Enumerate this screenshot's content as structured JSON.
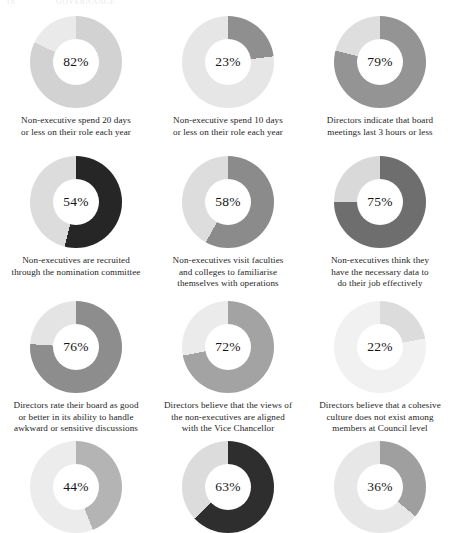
{
  "page_header": {
    "number": "18",
    "title": "GOVERNANCE",
    "visible": "partially cropped running header"
  },
  "layout": {
    "columns": 3,
    "rows": 4,
    "background": "#ffffff"
  },
  "palette": {
    "very_light_grey": "#e9e9e9",
    "light_grey": "#d5d5d5",
    "mid_grey": "#bdbdbd",
    "grey": "#9a9a9a",
    "dark_grey": "#808080",
    "near_black": "#2b2b2b",
    "hole": "#ffffff",
    "value_text": "#161616",
    "caption_text": "#1d1d1d"
  },
  "chart_data": {
    "type": "pie",
    "subtype": "donut-grid",
    "legend": "none",
    "units": "percent",
    "charts": [
      {
        "id": "chart-1",
        "value": 82,
        "value_label": "82%",
        "remainder": 18,
        "fill_color": "#d2d2d2",
        "track_color": "#eaeaea",
        "caption": [
          "Non-executive spend 20 days",
          "or less on their role each year"
        ],
        "row": 1,
        "col": 1
      },
      {
        "id": "chart-2",
        "value": 23,
        "value_label": "23%",
        "remainder": 77,
        "fill_color": "#8f8f8f",
        "track_color": "#e6e6e6",
        "caption": [
          "Non-executive spend 10 days",
          "or less on their role each year"
        ],
        "row": 1,
        "col": 2
      },
      {
        "id": "chart-3",
        "value": 79,
        "value_label": "79%",
        "remainder": 21,
        "fill_color": "#949494",
        "track_color": "#dedede",
        "caption": [
          "Directors indicate that board",
          "meetings last 3 hours or less"
        ],
        "row": 1,
        "col": 3
      },
      {
        "id": "chart-4",
        "value": 54,
        "value_label": "54%",
        "remainder": 46,
        "fill_color": "#262626",
        "track_color": "#dcdcdc",
        "caption": [
          "Non-executives are recruited",
          "through the nomination committee"
        ],
        "row": 2,
        "col": 1
      },
      {
        "id": "chart-5",
        "value": 58,
        "value_label": "58%",
        "remainder": 42,
        "fill_color": "#8b8b8b",
        "track_color": "#dddddd",
        "caption": [
          "Non-executives visit faculties",
          "and colleges to familiarise",
          "themselves with operations"
        ],
        "row": 2,
        "col": 2
      },
      {
        "id": "chart-6",
        "value": 75,
        "value_label": "75%",
        "remainder": 25,
        "fill_color": "#6e6e6e",
        "track_color": "#d9d9d9",
        "caption": [
          "Non-executives think they",
          "have the necessary data to",
          "do their job effectively"
        ],
        "row": 2,
        "col": 3
      },
      {
        "id": "chart-7",
        "value": 76,
        "value_label": "76%",
        "remainder": 24,
        "fill_color": "#8d8d8d",
        "track_color": "#e4e4e4",
        "caption": [
          "Directors rate their board as good",
          "or better in its ability to handle",
          "awkward or sensitive discussions"
        ],
        "row": 3,
        "col": 1
      },
      {
        "id": "chart-8",
        "value": 72,
        "value_label": "72%",
        "remainder": 28,
        "fill_color": "#a3a3a3",
        "track_color": "#ebebeb",
        "caption": [
          "Directors believe that the views of",
          "the non-executives are aligned",
          "with the Vice Chancellor"
        ],
        "row": 3,
        "col": 2
      },
      {
        "id": "chart-9",
        "value": 22,
        "value_label": "22%",
        "remainder": 78,
        "fill_color": "#dcdcdc",
        "track_color": "#f1f1f1",
        "caption": [
          "Directors believe that a cohesive",
          "culture does not exist among",
          "members at Council level"
        ],
        "row": 3,
        "col": 3
      },
      {
        "id": "chart-10",
        "value": 44,
        "value_label": "44%",
        "remainder": 56,
        "fill_color": "#b4b4b4",
        "track_color": "#ececec",
        "caption": [
          "Chairs effectively deal with",
          "non-performing or disruptive"
        ],
        "row": 4,
        "col": 1
      },
      {
        "id": "chart-11",
        "value": 63,
        "value_label": "63%",
        "remainder": 37,
        "fill_color": "#2e2e2e",
        "track_color": "#dcdcdc",
        "caption": [
          "Chairs have effective relations",
          "with external stakeholders"
        ],
        "row": 4,
        "col": 2
      },
      {
        "id": "chart-12",
        "value": 36,
        "value_label": "36%",
        "remainder": 64,
        "fill_color": "#9f9f9f",
        "track_color": "#e7e7e7",
        "caption": [
          "Directors say that the",
          "Council is risk averse"
        ],
        "row": 4,
        "col": 3
      }
    ]
  }
}
